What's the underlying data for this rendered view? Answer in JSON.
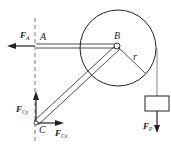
{
  "diagram": {
    "points": {
      "A": "A",
      "B": "B",
      "C": "C",
      "r": "r"
    },
    "forces": {
      "FA": {
        "main": "F",
        "sub": "A"
      },
      "FCy": {
        "main": "F",
        "sub": "Cy"
      },
      "FCx": {
        "main": "F",
        "sub": "Cx"
      },
      "FP": {
        "main": "F",
        "sub": "P"
      }
    },
    "colors": {
      "stroke": "#222222",
      "rope": "#666666"
    }
  }
}
